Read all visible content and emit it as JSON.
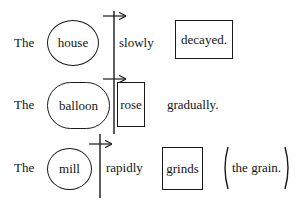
{
  "rows": [
    {
      "determiner": "The",
      "subject": "house",
      "adverb": "slowly",
      "verb": "decayed."
    },
    {
      "determiner": "The",
      "subject": "balloon",
      "verb": "rose",
      "adverb": "gradually."
    },
    {
      "determiner": "The",
      "subject": "mill",
      "adverb": "rapidly",
      "verb": "grinds",
      "object": "the grain."
    }
  ],
  "notation": {
    "subject_shape": "ellipse",
    "verb_shape": "rectangle",
    "object_shape": "parentheses",
    "boundary_marker": "vertical-line-with-right-arrow"
  }
}
